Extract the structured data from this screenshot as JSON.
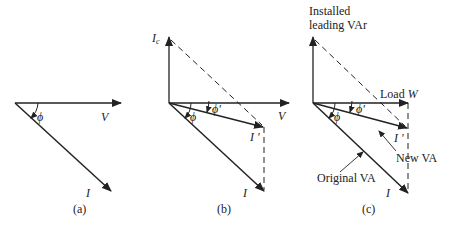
{
  "figure": {
    "panels": [
      {
        "id": "a",
        "caption": "(a)",
        "labels": {
          "voltage": "V",
          "current": "I",
          "angle": "ϕ"
        }
      },
      {
        "id": "b",
        "caption": "(b)",
        "labels": {
          "capacitor_current": "I",
          "capacitor_sub": "c",
          "voltage": "V",
          "new_current": "I '",
          "current": "I",
          "angle": "ϕ",
          "new_angle": "ϕ'"
        }
      },
      {
        "id": "c",
        "caption": "(c)",
        "labels": {
          "installed_line1": "Installed",
          "installed_line2": "leading VAr",
          "load_prefix": "Load ",
          "load_var": "W",
          "new_current": "I '",
          "current": "I",
          "angle": "ϕ",
          "new_angle": "ϕ'",
          "new_va": "New VA",
          "original_va": "Original VA"
        }
      }
    ],
    "colors": {
      "line": "#222222",
      "background": "#ffffff"
    }
  }
}
